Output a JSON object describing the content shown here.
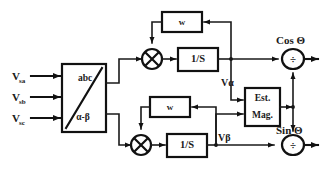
{
  "figure": {
    "background_color": "#ffffff",
    "line_color": "#111111",
    "text_color": "#1a1a1a"
  },
  "inputs": {
    "items": [
      {
        "id": "vsa",
        "label": "V",
        "sub": "sa"
      },
      {
        "id": "vsb",
        "label": "V",
        "sub": "sb"
      },
      {
        "id": "vsc",
        "label": "V",
        "sub": "sc"
      }
    ]
  },
  "blocks": {
    "transform": {
      "top_label": "abc",
      "bottom_label": "α-β"
    },
    "omega_top": {
      "label": "w"
    },
    "omega_bottom": {
      "label": "w"
    },
    "integrator_top": {
      "label": "1/S"
    },
    "integrator_bottom": {
      "label": "1/S"
    },
    "est_mag": {
      "line1": "Est.",
      "line2": "Mag."
    },
    "multiplier_top": {
      "symbol": "×"
    },
    "multiplier_bottom": {
      "symbol": "×"
    },
    "divider_top": {
      "symbol": "÷"
    },
    "divider_bottom": {
      "symbol": "÷"
    }
  },
  "signals": {
    "v_alpha": "Vα",
    "v_beta": "Vβ"
  },
  "outputs": {
    "cos": "Cos Θ",
    "sin": "Sin Θ"
  }
}
